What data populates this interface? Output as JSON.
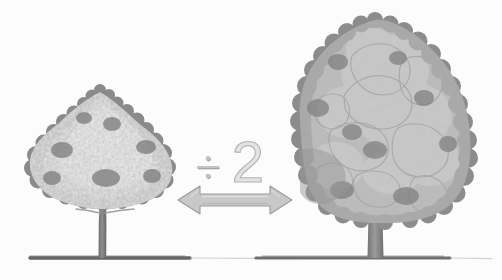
{
  "scene": {
    "title": "Tree size comparison with division operator",
    "background_color": "#fcfcfc",
    "ground_line_color": "#6f6f6f",
    "width": 502,
    "height": 280
  },
  "operation": {
    "divide_sign": "÷",
    "divisor": "2",
    "symbol_color": "#c2c2c2",
    "number_color": "#e3e3e3",
    "number_outline_color": "#b3b3b3"
  },
  "arrow": {
    "label": "",
    "direction": "double-headed-horizontal",
    "fill_color": "#c8c8c8",
    "outline_color": "#9b9b9b",
    "left_tip_x": 178,
    "right_tip_x": 292,
    "center_y": 200
  },
  "trees": [
    {
      "id": "left-tree",
      "role": "result",
      "relative_size": "small",
      "canopy_left": 28,
      "canopy_right": 172,
      "canopy_top": 88,
      "trunk_x": 102,
      "base_y": 258,
      "canopy_light_color": "#e8e8e8",
      "canopy_mid_color": "#bdbdbd",
      "canopy_dark_color": "#888888",
      "trunk_color": "#7d7d7d"
    },
    {
      "id": "right-tree",
      "role": "original",
      "relative_size": "large",
      "canopy_left": 300,
      "canopy_right": 470,
      "canopy_top": 20,
      "trunk_x": 375,
      "base_y": 258,
      "canopy_light_color": "#cfcfcf",
      "canopy_mid_color": "#b0b0b0",
      "canopy_dark_color": "#8d8d8d",
      "trunk_color": "#8a8a8a"
    }
  ]
}
